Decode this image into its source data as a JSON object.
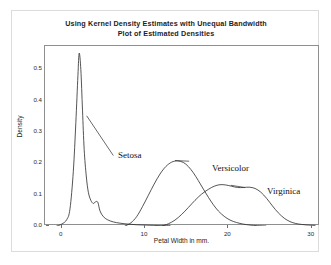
{
  "top_sliver": {
    "text": "· ·· ·· ·· ·· ·· · ·· ·· ··· ·· ·"
  },
  "chart_data": {
    "type": "line",
    "title": "Using Kernel Density Estimates with Unequal Bandwidth",
    "subtitle": "Plot of Estimated Densities",
    "xlabel": "Petal Width in mm.",
    "ylabel": "Density",
    "xlim": [
      -2,
      31
    ],
    "ylim": [
      0.0,
      0.575
    ],
    "xticks": [
      0,
      10,
      20,
      30
    ],
    "xtick_labels": [
      "0",
      "10",
      "20",
      "30"
    ],
    "yticks": [
      0.0,
      0.1,
      0.2,
      0.3,
      0.4,
      0.5
    ],
    "ytick_labels": [
      "0.0",
      "0.1",
      "0.2",
      "0.3",
      "0.4",
      "0.5"
    ],
    "grid": false,
    "legend": "annotations",
    "line_color": "#2a2a2a",
    "annotations": [
      {
        "label": "Setosa",
        "x": 4.9,
        "y": 0.245,
        "anchor_x": 2.9,
        "anchor_y": 0.355
      },
      {
        "label": "Versicolor",
        "x": 15.9,
        "y": 0.205,
        "anchor_x": 13.3,
        "anchor_y": 0.222
      },
      {
        "label": "Virginica",
        "x": 22.6,
        "y": 0.118,
        "anchor_x": 20.6,
        "anchor_y": 0.135
      }
    ],
    "series": [
      {
        "name": "Setosa",
        "points": [
          [
            -0.6,
            0.0
          ],
          [
            0.0,
            0.006
          ],
          [
            0.6,
            0.02
          ],
          [
            1.0,
            0.055
          ],
          [
            1.4,
            0.175
          ],
          [
            1.7,
            0.33
          ],
          [
            1.95,
            0.48
          ],
          [
            2.1,
            0.552
          ],
          [
            2.3,
            0.5
          ],
          [
            2.5,
            0.37
          ],
          [
            2.7,
            0.245
          ],
          [
            2.95,
            0.16
          ],
          [
            3.2,
            0.108
          ],
          [
            3.5,
            0.082
          ],
          [
            3.8,
            0.072
          ],
          [
            4.1,
            0.078
          ],
          [
            4.35,
            0.075
          ],
          [
            4.6,
            0.048
          ],
          [
            5.0,
            0.03
          ],
          [
            5.5,
            0.02
          ],
          [
            6.2,
            0.013
          ],
          [
            7.0,
            0.009
          ],
          [
            8.0,
            0.006
          ],
          [
            9.0,
            0.004
          ],
          [
            10.0,
            0.003
          ],
          [
            11.0,
            0.002
          ],
          [
            12.0,
            0.001
          ],
          [
            13.0,
            0.001
          ]
        ]
      },
      {
        "name": "Versicolor",
        "points": [
          [
            7.6,
            0.0
          ],
          [
            8.3,
            0.01
          ],
          [
            9.0,
            0.03
          ],
          [
            9.7,
            0.062
          ],
          [
            10.4,
            0.098
          ],
          [
            11.1,
            0.134
          ],
          [
            11.8,
            0.166
          ],
          [
            12.5,
            0.19
          ],
          [
            13.2,
            0.204
          ],
          [
            13.9,
            0.208
          ],
          [
            14.6,
            0.203
          ],
          [
            15.2,
            0.19
          ],
          [
            15.8,
            0.17
          ],
          [
            16.4,
            0.145
          ],
          [
            17.0,
            0.118
          ],
          [
            17.6,
            0.092
          ],
          [
            18.2,
            0.068
          ],
          [
            18.8,
            0.048
          ],
          [
            19.5,
            0.031
          ],
          [
            20.2,
            0.019
          ],
          [
            21.0,
            0.011
          ],
          [
            21.8,
            0.006
          ],
          [
            22.6,
            0.003
          ],
          [
            23.5,
            0.001
          ],
          [
            24.5,
            0.0
          ]
        ]
      },
      {
        "name": "Virginica",
        "points": [
          [
            12.0,
            0.0
          ],
          [
            12.8,
            0.007
          ],
          [
            13.6,
            0.019
          ],
          [
            14.4,
            0.037
          ],
          [
            15.2,
            0.059
          ],
          [
            16.0,
            0.082
          ],
          [
            16.8,
            0.102
          ],
          [
            17.6,
            0.117
          ],
          [
            18.3,
            0.127
          ],
          [
            19.0,
            0.132
          ],
          [
            19.7,
            0.131
          ],
          [
            20.4,
            0.127
          ],
          [
            21.1,
            0.123
          ],
          [
            21.8,
            0.123
          ],
          [
            22.5,
            0.124
          ],
          [
            23.2,
            0.12
          ],
          [
            23.9,
            0.108
          ],
          [
            24.6,
            0.088
          ],
          [
            25.3,
            0.064
          ],
          [
            26.0,
            0.042
          ],
          [
            26.7,
            0.025
          ],
          [
            27.4,
            0.014
          ],
          [
            28.1,
            0.008
          ],
          [
            28.8,
            0.005
          ],
          [
            29.6,
            0.003
          ],
          [
            30.4,
            0.002
          ]
        ]
      }
    ]
  }
}
